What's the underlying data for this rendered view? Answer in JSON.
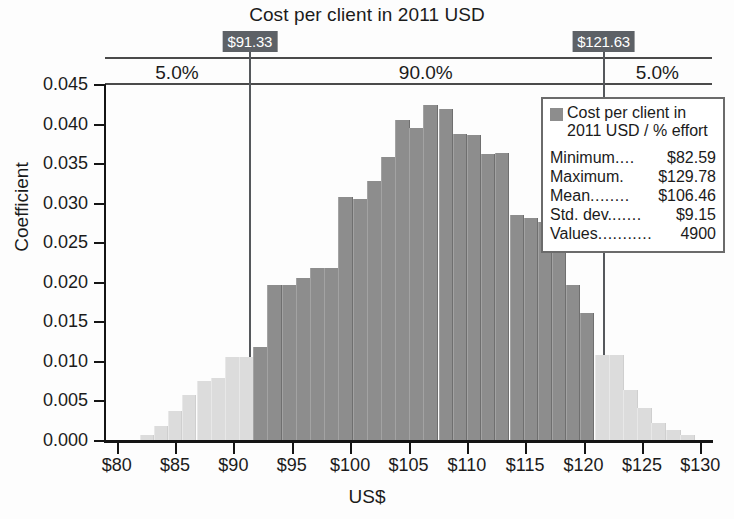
{
  "chart_data": {
    "type": "bar",
    "title": "Cost per client in 2011 USD",
    "xlabel": "US$",
    "ylabel": "Coefficient",
    "xlim": [
      79,
      131
    ],
    "ylim": [
      0.0,
      0.045
    ],
    "grid": false,
    "legend_position": "top-right inside",
    "x_ticks": [
      "$80",
      "$85",
      "$90",
      "$95",
      "$100",
      "$105",
      "$110",
      "$115",
      "$120",
      "$125",
      "$130"
    ],
    "x_tick_values": [
      80,
      85,
      90,
      95,
      100,
      105,
      110,
      115,
      120,
      125,
      130
    ],
    "y_ticks": [
      "0.000",
      "0.005",
      "0.010",
      "0.015",
      "0.020",
      "0.025",
      "0.030",
      "0.035",
      "0.040",
      "0.045"
    ],
    "y_tick_values": [
      0.0,
      0.005,
      0.01,
      0.015,
      0.02,
      0.025,
      0.03,
      0.035,
      0.04,
      0.045
    ],
    "bin_width": 1.25,
    "series": [
      {
        "name": "Cost per client in 2011 USD / % effort",
        "bins": [
          {
            "x": 82.6,
            "value": 0.0006,
            "in_range": false
          },
          {
            "x": 83.8,
            "value": 0.0018,
            "in_range": false
          },
          {
            "x": 85.0,
            "value": 0.0037,
            "in_range": false
          },
          {
            "x": 86.2,
            "value": 0.0057,
            "in_range": false
          },
          {
            "x": 87.5,
            "value": 0.0075,
            "in_range": false
          },
          {
            "x": 88.7,
            "value": 0.0078,
            "in_range": false
          },
          {
            "x": 89.9,
            "value": 0.0105,
            "in_range": false
          },
          {
            "x": 91.1,
            "value": 0.0105,
            "in_range": false
          },
          {
            "x": 92.3,
            "value": 0.0118,
            "in_range": true
          },
          {
            "x": 93.5,
            "value": 0.0196,
            "in_range": true
          },
          {
            "x": 94.8,
            "value": 0.0196,
            "in_range": true
          },
          {
            "x": 96.0,
            "value": 0.0205,
            "in_range": true
          },
          {
            "x": 97.2,
            "value": 0.0217,
            "in_range": true
          },
          {
            "x": 98.4,
            "value": 0.0218,
            "in_range": true
          },
          {
            "x": 99.6,
            "value": 0.0307,
            "in_range": true
          },
          {
            "x": 100.9,
            "value": 0.0305,
            "in_range": true
          },
          {
            "x": 102.1,
            "value": 0.0327,
            "in_range": true
          },
          {
            "x": 103.3,
            "value": 0.0358,
            "in_range": true
          },
          {
            "x": 104.5,
            "value": 0.0405,
            "in_range": true
          },
          {
            "x": 105.7,
            "value": 0.0395,
            "in_range": true
          },
          {
            "x": 106.9,
            "value": 0.0423,
            "in_range": true
          },
          {
            "x": 108.2,
            "value": 0.0418,
            "in_range": true
          },
          {
            "x": 109.4,
            "value": 0.0387,
            "in_range": true
          },
          {
            "x": 110.6,
            "value": 0.0385,
            "in_range": true
          },
          {
            "x": 111.8,
            "value": 0.0361,
            "in_range": true
          },
          {
            "x": 113.0,
            "value": 0.0363,
            "in_range": true
          },
          {
            "x": 114.3,
            "value": 0.0285,
            "in_range": true
          },
          {
            "x": 115.5,
            "value": 0.0281,
            "in_range": true
          },
          {
            "x": 116.7,
            "value": 0.0275,
            "in_range": true
          },
          {
            "x": 117.9,
            "value": 0.0243,
            "in_range": true
          },
          {
            "x": 119.1,
            "value": 0.0196,
            "in_range": true
          },
          {
            "x": 120.3,
            "value": 0.016,
            "in_range": true
          },
          {
            "x": 121.6,
            "value": 0.0108,
            "in_range": false
          },
          {
            "x": 122.8,
            "value": 0.0108,
            "in_range": false
          },
          {
            "x": 124.0,
            "value": 0.0063,
            "in_range": false
          },
          {
            "x": 125.2,
            "value": 0.004,
            "in_range": false
          },
          {
            "x": 126.4,
            "value": 0.0022,
            "in_range": false
          },
          {
            "x": 127.7,
            "value": 0.0013,
            "in_range": false
          },
          {
            "x": 128.9,
            "value": 0.0006,
            "in_range": false
          }
        ]
      }
    ],
    "percentile_markers": [
      {
        "label": "$91.33",
        "value": 91.33
      },
      {
        "label": "$121.63",
        "value": 121.63
      }
    ],
    "percentile_bands": [
      {
        "label": "5.0%",
        "from": 79,
        "to": 91.33
      },
      {
        "label": "90.0%",
        "from": 91.33,
        "to": 121.63
      },
      {
        "label": "5.0%",
        "from": 121.63,
        "to": 131
      }
    ],
    "legend": {
      "swatch_color": "#8d8d8d",
      "title": "Cost per client in 2011 USD / % effort",
      "title_line1": "Cost per client in",
      "title_line2": "2011 USD / % effort",
      "stats": [
        {
          "name": "Minimum",
          "dots": "....",
          "value": "$82.59"
        },
        {
          "name": "Maximum",
          "dots": ".",
          "value": "$129.78"
        },
        {
          "name": "Mean",
          "dots": "........",
          "value": "$106.46"
        },
        {
          "name": "Std. dev. ",
          "dots": "......",
          "value": "$9.15"
        },
        {
          "name": "Values ",
          "dots": "...........",
          "value": "4900"
        }
      ]
    },
    "colors": {
      "bar_in_range": "#8d8d8d",
      "bar_tail": "#dcdcdc",
      "axis": "#141414",
      "marker_chip_bg": "#5d6166",
      "marker_chip_text": "#ffffff",
      "band_rule": "#4a4a4a"
    }
  }
}
